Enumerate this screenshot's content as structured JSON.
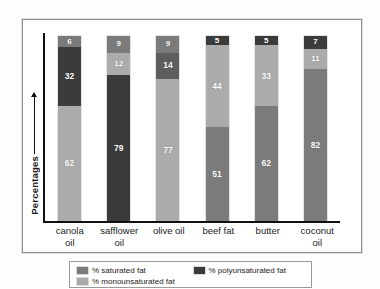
{
  "chart_data": {
    "type": "bar",
    "subtype": "stacked-100",
    "title": "",
    "xlabel": "",
    "ylabel": "Percentages",
    "ylim": [
      0,
      100
    ],
    "grid": false,
    "legend_position": "bottom",
    "categories": [
      "canola\noil",
      "safflower\noil",
      "olive oil",
      "beef fat",
      "butter",
      "coconut\noil"
    ],
    "series": [
      {
        "name": "% saturated fat",
        "key": "saturated",
        "color": "#7b7b7b",
        "values": [
          6,
          9,
          9,
          51,
          62,
          82
        ]
      },
      {
        "name": "% monounsaturated fat",
        "key": "monounsaturated",
        "color": "#ababab",
        "values": [
          62,
          12,
          77,
          44,
          33,
          11
        ]
      },
      {
        "name": "% polyunsaturated fat",
        "key": "polyunsaturated",
        "color": "#3b3b3b",
        "values": [
          32,
          79,
          14,
          5,
          5,
          7
        ]
      }
    ],
    "bars": [
      {
        "category": "canola\noil",
        "segments": [
          {
            "series": "% saturated fat",
            "value": 6,
            "color": "#7b7b7b",
            "label": "6"
          },
          {
            "series": "% polyunsaturated fat",
            "value": 32,
            "color": "#3b3b3b",
            "label": "32"
          },
          {
            "series": "% monounsaturated fat",
            "value": 62,
            "color": "#ababab",
            "label": "62"
          }
        ]
      },
      {
        "category": "safflower\noil",
        "segments": [
          {
            "series": "% saturated fat",
            "value": 9,
            "color": "#7b7b7b",
            "label": "9"
          },
          {
            "series": "% monounsaturated fat",
            "value": 12,
            "color": "#ababab",
            "label": "12"
          },
          {
            "series": "% polyunsaturated fat",
            "value": 79,
            "color": "#3b3b3b",
            "label": "79"
          }
        ]
      },
      {
        "category": "olive oil",
        "segments": [
          {
            "series": "% saturated fat",
            "value": 9,
            "color": "#7b7b7b",
            "label": "9"
          },
          {
            "series": "% polyunsaturated fat",
            "value": 14,
            "color": "#5e5e5e",
            "label": "14"
          },
          {
            "series": "% monounsaturated fat",
            "value": 77,
            "color": "#ababab",
            "label": "77"
          }
        ]
      },
      {
        "category": "beef fat",
        "segments": [
          {
            "series": "% polyunsaturated fat",
            "value": 5,
            "color": "#3b3b3b",
            "label": "5"
          },
          {
            "series": "% monounsaturated fat",
            "value": 44,
            "color": "#ababab",
            "label": "44"
          },
          {
            "series": "% saturated fat",
            "value": 51,
            "color": "#7b7b7b",
            "label": "51"
          }
        ]
      },
      {
        "category": "butter",
        "segments": [
          {
            "series": "% polyunsaturated fat",
            "value": 5,
            "color": "#3b3b3b",
            "label": "5"
          },
          {
            "series": "% monounsaturated fat",
            "value": 33,
            "color": "#ababab",
            "label": "33"
          },
          {
            "series": "% saturated fat",
            "value": 62,
            "color": "#7b7b7b",
            "label": "62"
          }
        ]
      },
      {
        "category": "coconut\noil",
        "segments": [
          {
            "series": "% polyunsaturated fat",
            "value": 7,
            "color": "#3b3b3b",
            "label": "7"
          },
          {
            "series": "% monounsaturated fat",
            "value": 11,
            "color": "#ababab",
            "label": "11"
          },
          {
            "series": "% saturated fat",
            "value": 82,
            "color": "#7b7b7b",
            "label": "82"
          }
        ]
      }
    ]
  },
  "axis": {
    "y_title": "Percentages"
  },
  "legend": {
    "items": [
      {
        "label": "% saturated fat",
        "color": "#7b7b7b"
      },
      {
        "label": "% polyunsaturated fat",
        "color": "#3b3b3b"
      },
      {
        "label": "% monounsaturated fat",
        "color": "#ababab"
      }
    ]
  }
}
